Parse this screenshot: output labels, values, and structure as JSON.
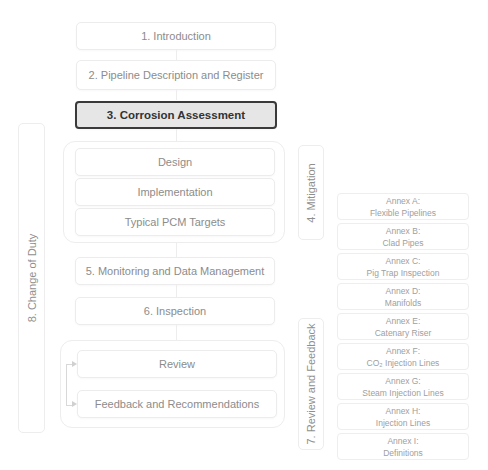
{
  "diagram": {
    "sections": [
      {
        "id": "introduction",
        "label": "1. Introduction"
      },
      {
        "id": "pipeline-description",
        "label": "2. Pipeline Description and Register"
      },
      {
        "id": "corrosion-assessment",
        "label": "3. Corrosion Assessment",
        "active": true
      },
      {
        "id": "monitoring",
        "label": "5. Monitoring and Data Management"
      },
      {
        "id": "inspection",
        "label": "6. Inspection"
      }
    ],
    "mitigation": {
      "label": "4. Mitigation",
      "items": [
        "Design",
        "Implementation",
        "Typical PCM Targets"
      ]
    },
    "review_feedback": {
      "label": "7. Review and Feedback",
      "items": [
        "Review",
        "Feedback and Recommendations"
      ]
    },
    "change_of_duty": {
      "label": "8. Change of Duty"
    },
    "annexes": [
      {
        "title": "Annex A:",
        "subtitle": "Flexible Pipelines"
      },
      {
        "title": "Annex B:",
        "subtitle": "Clad Pipes"
      },
      {
        "title": "Annex C:",
        "subtitle": "Pig Trap Inspection"
      },
      {
        "title": "Annex D:",
        "subtitle": "Manifolds"
      },
      {
        "title": "Annex E:",
        "subtitle": "Catenary Riser"
      },
      {
        "title": "Annex F:",
        "subtitle": "CO₂ Injection Lines"
      },
      {
        "title": "Annex G:",
        "subtitle": "Steam Injection Lines"
      },
      {
        "title": "Annex H:",
        "subtitle": "Injection Lines"
      },
      {
        "title": "Annex I:",
        "subtitle": "Definitions"
      }
    ],
    "colors": {
      "active_border": "#3a3a3a",
      "active_fill": "#e6e6e6",
      "inactive_text": "#8c8c8c",
      "box_border": "#ececec"
    }
  }
}
